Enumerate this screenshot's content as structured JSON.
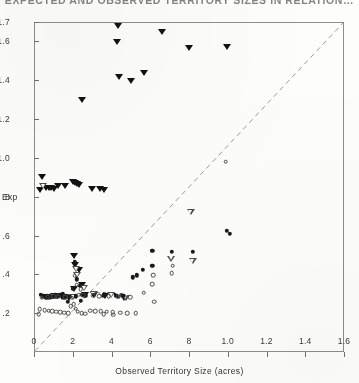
{
  "chart_data": {
    "type": "scatter",
    "title": "EXPECTED AND OBSERVED TERRITORY SIZES IN RELATION…",
    "xlabel": "Observed Territory  Size (acres)",
    "ylabel": "Exp",
    "xlim": [
      0,
      16
    ],
    "ylim": [
      0,
      1.7
    ],
    "grid": false,
    "legend_position": "none",
    "xticks": [
      0,
      2,
      4,
      6,
      8,
      10,
      12,
      14,
      16
    ],
    "xticklabels": [
      "0",
      "2",
      "4",
      "6",
      "8",
      "1.0",
      "1.2",
      "1.4",
      "1.6"
    ],
    "yticks": [
      0.2,
      0.4,
      0.6,
      0.8,
      1.0,
      1.2,
      1.4,
      1.6,
      1.7
    ],
    "yticklabels": [
      ".2",
      ".4",
      ".6",
      ".8",
      "1.0",
      "1.2",
      "1.4",
      "1.6",
      "1.7"
    ],
    "reference_line": {
      "type": "dashed",
      "label": "1:1 line",
      "from": [
        0.0,
        0.0
      ],
      "to": [
        16.0,
        1.7
      ]
    },
    "series": [
      {
        "name": "filled-down-triangle",
        "marker": "filled-triangle-down",
        "color": "#121212",
        "points": [
          [
            4.3,
            1.685
          ],
          [
            4.25,
            1.6
          ],
          [
            6.55,
            1.655
          ],
          [
            5.6,
            1.445
          ],
          [
            7.95,
            1.57
          ],
          [
            9.9,
            1.575
          ],
          [
            4.35,
            1.42
          ],
          [
            4.95,
            1.4
          ],
          [
            2.45,
            1.305
          ],
          [
            0.35,
            0.905
          ],
          [
            1.95,
            0.88
          ],
          [
            2.05,
            0.875
          ],
          [
            2.15,
            0.872
          ],
          [
            2.25,
            0.868
          ],
          [
            1.2,
            0.862
          ],
          [
            1.55,
            0.858
          ],
          [
            0.55,
            0.852
          ],
          [
            0.7,
            0.85
          ],
          [
            0.85,
            0.848
          ],
          [
            1.0,
            0.846
          ],
          [
            2.95,
            0.845
          ],
          [
            3.35,
            0.843
          ],
          [
            3.55,
            0.841
          ],
          [
            0.25,
            0.838
          ],
          [
            2.0,
            0.5
          ],
          [
            2.05,
            0.452
          ],
          [
            2.25,
            0.43
          ],
          [
            2.45,
            0.348
          ],
          [
            2.0,
            0.33
          ],
          [
            2.6,
            0.3
          ],
          [
            3.05,
            0.298
          ],
          [
            3.6,
            0.296
          ],
          [
            4.25,
            0.294
          ],
          [
            1.0,
            0.292
          ],
          [
            0.6,
            0.288
          ],
          [
            1.4,
            0.286
          ],
          [
            1.75,
            0.284
          ],
          [
            4.6,
            0.282
          ]
        ]
      },
      {
        "name": "open-down-triangle",
        "marker": "open-triangle-down",
        "color": "#4d4d4d",
        "points": [
          [
            0.45,
            0.855
          ],
          [
            2.15,
            0.43
          ],
          [
            2.2,
            0.398
          ],
          [
            2.55,
            0.332
          ],
          [
            3.05,
            0.3
          ],
          [
            3.45,
            0.297
          ],
          [
            3.95,
            0.295
          ],
          [
            4.35,
            0.293
          ],
          [
            1.15,
            0.29
          ],
          [
            0.85,
            0.287
          ],
          [
            1.6,
            0.285
          ],
          [
            2.0,
            0.283
          ],
          [
            4.7,
            0.281
          ],
          [
            8.05,
            0.722
          ],
          [
            7.05,
            0.482
          ],
          [
            8.15,
            0.47
          ]
        ]
      },
      {
        "name": "filled-circle",
        "marker": "filled-circle",
        "color": "#1a1a1a",
        "points": [
          [
            0.3,
            0.3
          ],
          [
            0.45,
            0.296
          ],
          [
            0.6,
            0.294
          ],
          [
            0.75,
            0.292
          ],
          [
            0.95,
            0.29
          ],
          [
            1.1,
            0.288
          ],
          [
            1.3,
            0.3
          ],
          [
            1.45,
            0.305
          ],
          [
            1.6,
            0.292
          ],
          [
            1.8,
            0.29
          ],
          [
            1.95,
            0.33
          ],
          [
            2.05,
            0.47
          ],
          [
            2.15,
            0.38
          ],
          [
            2.3,
            0.345
          ],
          [
            2.45,
            0.3
          ],
          [
            2.6,
            0.296
          ],
          [
            2.1,
            0.292
          ],
          [
            1.25,
            0.296
          ],
          [
            0.4,
            0.292
          ],
          [
            0.85,
            0.288
          ],
          [
            1.05,
            0.298
          ],
          [
            3.05,
            0.3
          ],
          [
            3.55,
            0.298
          ],
          [
            4.2,
            0.296
          ],
          [
            4.55,
            0.295
          ],
          [
            0.55,
            0.286
          ],
          [
            0.7,
            0.284
          ],
          [
            1.5,
            0.284
          ],
          [
            5.05,
            0.39
          ],
          [
            5.25,
            0.4
          ],
          [
            5.55,
            0.428
          ],
          [
            6.05,
            0.45
          ],
          [
            6.05,
            0.525
          ],
          [
            7.05,
            0.52
          ],
          [
            8.15,
            0.52
          ],
          [
            9.9,
            0.628
          ],
          [
            10.05,
            0.615
          ],
          [
            2.35,
            0.268
          ],
          [
            1.7,
            0.265
          ]
        ]
      },
      {
        "name": "open-circle",
        "marker": "open-circle",
        "color": "#4a4a4a",
        "points": [
          [
            0.25,
            0.225
          ],
          [
            0.5,
            0.222
          ],
          [
            0.7,
            0.218
          ],
          [
            0.9,
            0.215
          ],
          [
            1.1,
            0.212
          ],
          [
            1.3,
            0.21
          ],
          [
            1.5,
            0.208
          ],
          [
            1.7,
            0.206
          ],
          [
            1.85,
            0.24
          ],
          [
            2.0,
            0.25
          ],
          [
            2.1,
            0.228
          ],
          [
            2.2,
            0.212
          ],
          [
            2.4,
            0.205
          ],
          [
            2.6,
            0.203
          ],
          [
            2.85,
            0.218
          ],
          [
            3.1,
            0.216
          ],
          [
            3.4,
            0.214
          ],
          [
            3.7,
            0.212
          ],
          [
            4.0,
            0.21
          ],
          [
            4.4,
            0.208
          ],
          [
            4.75,
            0.206
          ],
          [
            5.2,
            0.205
          ],
          [
            0.35,
            0.285
          ],
          [
            0.65,
            0.288
          ],
          [
            0.95,
            0.292
          ],
          [
            1.2,
            0.29
          ],
          [
            1.55,
            0.286
          ],
          [
            1.9,
            0.284
          ],
          [
            2.25,
            0.3
          ],
          [
            2.5,
            0.298
          ],
          [
            3.0,
            0.296
          ],
          [
            3.3,
            0.294
          ],
          [
            3.8,
            0.292
          ],
          [
            4.3,
            0.29
          ],
          [
            4.9,
            0.288
          ],
          [
            2.05,
            0.398
          ],
          [
            2.15,
            0.352
          ],
          [
            2.35,
            0.33
          ],
          [
            5.6,
            0.31
          ],
          [
            6.05,
            0.355
          ],
          [
            6.1,
            0.4
          ],
          [
            7.05,
            0.41
          ],
          [
            7.1,
            0.45
          ],
          [
            6.15,
            0.265
          ],
          [
            9.85,
            0.985
          ],
          [
            0.2,
            0.2
          ],
          [
            3.55,
            0.2
          ],
          [
            4.05,
            0.198
          ]
        ]
      }
    ]
  }
}
